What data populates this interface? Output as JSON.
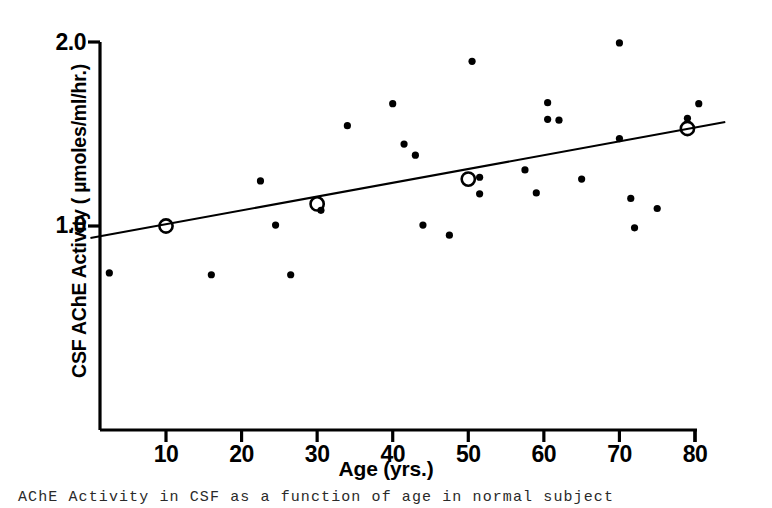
{
  "figure": {
    "caption_visible_fragment": "AChE Activity in CSF as a function of age in normal subject"
  },
  "chart_data": {
    "type": "scatter",
    "title": "",
    "xlabel": "Age (yrs.)",
    "ylabel": "CSF AChE Activity ( µmoles/ml/hr.)",
    "xlim": [
      0,
      84
    ],
    "ylim": [
      0.42,
      2.06
    ],
    "grid": false,
    "legend": "none",
    "xticks": [
      10,
      20,
      30,
      40,
      50,
      60,
      70,
      80
    ],
    "xticklabels": [
      "10",
      "20",
      "30",
      "40",
      "50",
      "60",
      "70",
      "80"
    ],
    "yticks": [
      1.0,
      2.0
    ],
    "yticklabels": [
      "1.0",
      "2.0"
    ],
    "series": [
      {
        "name": "individual subjects",
        "marker": "filled-circle",
        "color": "#000000",
        "points": [
          [
            2.5,
            0.745
          ],
          [
            16.0,
            0.735
          ],
          [
            22.5,
            1.245
          ],
          [
            24.5,
            1.005
          ],
          [
            26.5,
            0.735
          ],
          [
            30.5,
            1.085
          ],
          [
            34.0,
            1.545
          ],
          [
            40.0,
            1.665
          ],
          [
            41.5,
            1.445
          ],
          [
            43.0,
            1.385
          ],
          [
            44.0,
            1.005
          ],
          [
            47.5,
            0.95
          ],
          [
            50.5,
            1.895
          ],
          [
            51.5,
            1.265
          ],
          [
            51.5,
            1.175
          ],
          [
            57.5,
            1.305
          ],
          [
            59.0,
            1.18
          ],
          [
            60.5,
            1.67
          ],
          [
            60.5,
            1.58
          ],
          [
            62.0,
            1.575
          ],
          [
            65.0,
            1.255
          ],
          [
            70.0,
            1.995
          ],
          [
            70.0,
            1.475
          ],
          [
            71.5,
            1.15
          ],
          [
            72.0,
            0.99
          ],
          [
            75.0,
            1.095
          ],
          [
            79.0,
            1.585
          ],
          [
            80.5,
            1.665
          ]
        ]
      },
      {
        "name": "decade means",
        "marker": "open-circle",
        "color": "#000000",
        "points": [
          [
            10,
            1.0
          ],
          [
            30,
            1.12
          ],
          [
            50,
            1.255
          ],
          [
            79,
            1.53
          ]
        ]
      }
    ],
    "regression_line": {
      "x_start": 0.0,
      "y_start": 0.935,
      "x_end": 84.0,
      "y_end": 1.565
    }
  },
  "axes": {
    "y_tick_labels": {
      "top": "2.0",
      "bottom": "1.0"
    },
    "x_tick_labels": [
      "10",
      "20",
      "30",
      "40",
      "50",
      "60",
      "70",
      "80"
    ]
  }
}
